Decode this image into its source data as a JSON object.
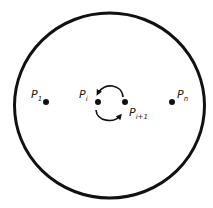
{
  "diagram": {
    "type": "points-on-disk-swap",
    "colors": {
      "stroke": "#111111",
      "background": "#ffffff",
      "text": "#1a1a1a"
    },
    "boundary": {
      "shape": "circle",
      "cx": 109.5,
      "cy": 105.5,
      "rx": 95,
      "ry": 92.5,
      "stroke_width": 3
    },
    "points": [
      {
        "id": "p1",
        "label_main": "P",
        "label_sub": "1",
        "x": 46,
        "y": 102,
        "label_x": 31,
        "label_y": 98
      },
      {
        "id": "pi",
        "label_main": "P",
        "label_sub": "i",
        "x": 98,
        "y": 102,
        "label_x": 79,
        "label_y": 98
      },
      {
        "id": "pi1",
        "label_main": "P",
        "label_sub": "i+1",
        "x": 125,
        "y": 102,
        "label_x": 129,
        "label_y": 116
      },
      {
        "id": "pn",
        "label_main": "P",
        "label_sub": "n",
        "x": 172,
        "y": 102,
        "label_x": 177,
        "label_y": 98
      }
    ],
    "swap_arrows": {
      "description": "counterclockwise exchange of P_i and P_{i+1}",
      "upper_arc": {
        "from": "pi1",
        "to": "pi",
        "direction": "over-top"
      },
      "lower_arc": {
        "from": "pi",
        "to": "pi1",
        "direction": "under-bottom"
      }
    }
  }
}
